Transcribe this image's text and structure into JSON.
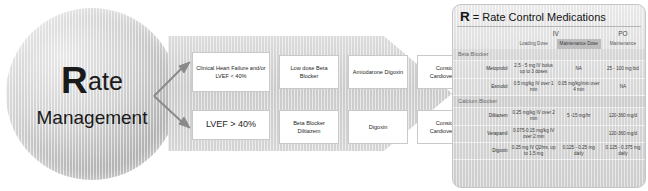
{
  "circle": {
    "line1_cap": "R",
    "line1_rest": "ate",
    "line2": "Management"
  },
  "flow": {
    "rows": [
      {
        "condition": "Clinical Heart Failure and/or LVEF < 40%",
        "step2": "Low dose Beta Blocker",
        "step3": "Amiodarone Digoxin",
        "step4": "Consider Cardioversion"
      },
      {
        "condition": "LVEF > 40%",
        "step2": "Beta Blocker Diltiazem",
        "step3": "Digoxin",
        "step4": "Consider Cardioversion"
      }
    ]
  },
  "panel": {
    "title_cap": "R",
    "title_rest": "= Rate Control Medications",
    "groups": {
      "iv": "IV",
      "po": "PO"
    },
    "subheaders": [
      "",
      "Loading Dose",
      "Maintenance Dose",
      "Maintenance"
    ],
    "sections": [
      {
        "name": "Beta Blocker",
        "rows": [
          {
            "drug": "Metoprolol",
            "loading": "2.5 - 5 mg IV bolus up to 3 doses",
            "maintenance_iv": "NA",
            "maintenance_po": "25 - 100 mg bid"
          },
          {
            "drug": "Esmolol",
            "loading": "0.5 mg/kg IV over 1 min",
            "maintenance_iv": "0.05 mg/kg/min over 4 min",
            "maintenance_po": "NA"
          }
        ]
      },
      {
        "name": "Calcium Blocker",
        "rows": [
          {
            "drug": "Diltiazem",
            "loading": "0.25 mg/kg IV over 2 min",
            "maintenance_iv": "5 -15 mg/hr",
            "maintenance_po": "120-360 mg/d"
          },
          {
            "drug": "Verapamil",
            "loading": "0.075-0.15 mg/kg IV over 2 min",
            "maintenance_iv": "",
            "maintenance_po": "120-360 mg/d"
          }
        ]
      },
      {
        "name": "",
        "rows": [
          {
            "drug": "Digoxin",
            "loading": "0.25 mg IV Q2hrs, up to 1.5 mg",
            "maintenance_iv": "0.125 - 0.25 mg daily",
            "maintenance_po": "0.125 - 0.375 mg daily"
          }
        ]
      }
    ]
  },
  "colors": {
    "panel_bg": "#e0e0e0",
    "chevron": "#d2d2d2",
    "box_border": "#c9c9c9",
    "arrow": "#8a8a8a"
  }
}
